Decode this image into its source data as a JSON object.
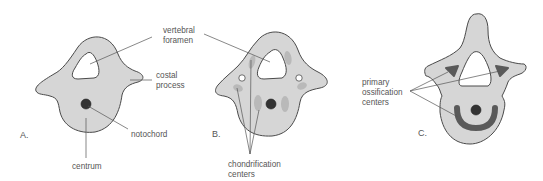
{
  "figure": {
    "panels": [
      {
        "id": "A",
        "label": "A.",
        "annotations": {
          "vertebral_foramen": [
            "vertebral",
            "foramen"
          ],
          "costal_process": [
            "costal",
            "process"
          ],
          "notochord": "notochord",
          "centrum": "centrum"
        }
      },
      {
        "id": "B",
        "label": "B.",
        "annotations": {
          "chondrification_centers": [
            "chondrification",
            "centers"
          ]
        }
      },
      {
        "id": "C",
        "label": "C.",
        "annotations": {
          "primary_ossification_centers": [
            "primary",
            "ossification",
            "centers"
          ]
        }
      }
    ],
    "colors": {
      "tissue_fill": "#d6d6d6",
      "outline": "#4a4a4a",
      "notochord": "#333333",
      "chondrification": "#b9b9b9",
      "ossification": "#5a5a5a",
      "leader_line": "#555555",
      "text": "#555555"
    }
  }
}
